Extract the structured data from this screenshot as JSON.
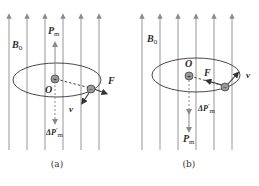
{
  "colors": {
    "field_line": "#8a8a8a",
    "stroke": "#333333",
    "charge_fill": "#9a9a9a",
    "background": "#ffffff"
  },
  "panels": [
    {
      "id": "a",
      "caption": "(a)",
      "field_label": "B",
      "field_label_sub": "0",
      "moment_label": "P",
      "moment_label_sub": "m",
      "delta_moment_label": "ΔP",
      "delta_moment_label_sub": "m",
      "delta_prime": "′",
      "center_label": "O",
      "force_label": "F",
      "velocity_label": "v",
      "positive_charge": "+",
      "negative_charge": "−",
      "moment_direction": "up",
      "delta_moment_direction": "down",
      "force_direction": "outward"
    },
    {
      "id": "b",
      "caption": "(b)",
      "field_label": "B",
      "field_label_sub": "0",
      "moment_label": "P",
      "moment_label_sub": "m",
      "delta_moment_label": "ΔP",
      "delta_moment_label_sub": "m",
      "delta_prime": "′",
      "center_label": "O",
      "force_label": "F",
      "velocity_label": "v",
      "positive_charge": "+",
      "negative_charge": "−",
      "moment_direction": "down",
      "delta_moment_direction": "down",
      "force_direction": "inward"
    }
  ]
}
